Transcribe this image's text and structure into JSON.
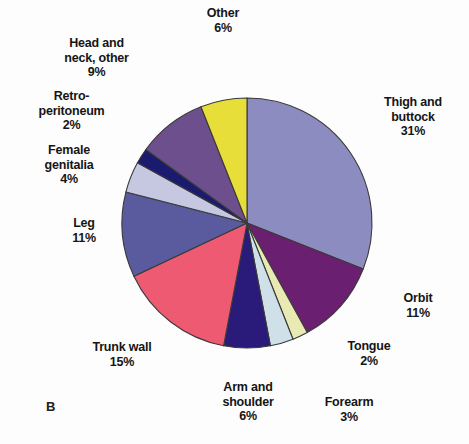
{
  "figure": {
    "panel_letter": "B",
    "background_color": "#fdfdfd",
    "center": {
      "x": 247,
      "y": 223
    },
    "radius": 125
  },
  "chart_data": {
    "type": "pie",
    "title": "",
    "subtitle": "",
    "xlabel": "",
    "ylabel": "",
    "legend_position": "none",
    "grid": false,
    "units": "percent",
    "start_angle_deg": 0,
    "direction": "clockwise",
    "categories": [
      "Thigh and buttock",
      "Orbit",
      "Tongue",
      "Forearm",
      "Arm and shoulder",
      "Trunk wall",
      "Leg",
      "Female genitalia",
      "Retroperitoneum",
      "Head and neck, other",
      "Other"
    ],
    "values": [
      31,
      11,
      2,
      3,
      6,
      15,
      11,
      4,
      2,
      9,
      6
    ],
    "colors": [
      "#8d8cc0",
      "#6b1f70",
      "#e9e9b4",
      "#cfe0e8",
      "#2a1a7a",
      "#ed5a72",
      "#5a5a9e",
      "#c5c8e0",
      "#1a1a6e",
      "#6e4f8e",
      "#e8de3a"
    ],
    "slices": [
      {
        "label": "Thigh and buttock",
        "value": 31,
        "value_text": "31%",
        "color": "#8d8cc0"
      },
      {
        "label": "Orbit",
        "value": 11,
        "value_text": "11%",
        "color": "#6b1f70"
      },
      {
        "label": "Tongue",
        "value": 2,
        "value_text": "2%",
        "color": "#e9e9b4"
      },
      {
        "label": "Forearm",
        "value": 3,
        "value_text": "3%",
        "color": "#cfe0e8"
      },
      {
        "label": "Arm and shoulder",
        "value": 6,
        "value_text": "6%",
        "color": "#2a1a7a"
      },
      {
        "label": "Trunk wall",
        "value": 15,
        "value_text": "15%",
        "color": "#ed5a72"
      },
      {
        "label": "Leg",
        "value": 11,
        "value_text": "11%",
        "color": "#5a5a9e"
      },
      {
        "label": "Female genitalia",
        "value": 4,
        "value_text": "4%",
        "color": "#c5c8e0"
      },
      {
        "label": "Retroperitoneum",
        "value": 2,
        "value_text": "2%",
        "color": "#1a1a6e"
      },
      {
        "label": "Head and neck, other",
        "value": 9,
        "value_text": "9%",
        "color": "#6e4f8e"
      },
      {
        "label": "Other",
        "value": 6,
        "value_text": "6%",
        "color": "#e8de3a"
      }
    ]
  },
  "labels": {
    "other": "Other\n6%",
    "head_and_neck_other": "Head and\nneck, other\n9%",
    "retroperitoneum": "Retro-\nperitoneum\n2%",
    "female_genitalia": "Female\ngenitalia\n4%",
    "leg": "Leg\n11%",
    "trunk_wall": "Trunk wall\n15%",
    "arm_and_shoulder": "Arm and\nshoulder\n6%",
    "forearm": "Forearm\n3%",
    "tongue": "Tongue\n2%",
    "orbit": "Orbit\n11%",
    "thigh_and_buttock": "Thigh and\nbuttock\n31%"
  }
}
